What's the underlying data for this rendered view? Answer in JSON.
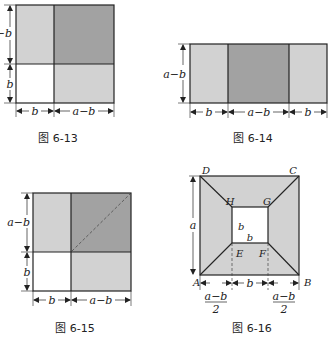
{
  "colors": {
    "light_gray": "#d2d2d2",
    "dark_gray": "#a2a2a2",
    "outline": "#222222",
    "white": "#ffffff"
  },
  "fig_6_13": {
    "caption": "图 6-13",
    "left_dims": [
      "a−b",
      "b"
    ],
    "bottom_dims": [
      "b",
      "a−b"
    ]
  },
  "fig_6_14": {
    "caption": "图 6-14",
    "left_dims": [
      "a−b"
    ],
    "bottom_dims": [
      "b",
      "a−b",
      "b"
    ]
  },
  "fig_6_15": {
    "caption": "图 6-15",
    "left_dims": [
      "a−b",
      "b"
    ],
    "bottom_dims": [
      "b",
      "a−b"
    ]
  },
  "fig_6_16": {
    "caption": "图 6-16",
    "points": {
      "A": "A",
      "B": "B",
      "C": "C",
      "D": "D",
      "E": "E",
      "F": "F",
      "G": "G",
      "H": "H"
    },
    "left_dim": "a",
    "inner_labels": {
      "side": "b",
      "bottom": "b"
    },
    "bottom_dims": {
      "left_num": "a−b",
      "left_den": "2",
      "middle": "b",
      "right_num": "a−b",
      "right_den": "2"
    }
  }
}
